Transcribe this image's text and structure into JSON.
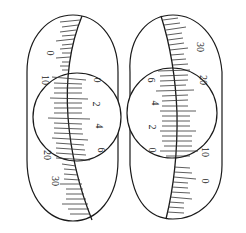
{
  "diagram": {
    "stroke_color": "#1a1a1a",
    "tick_color": "#333333",
    "left": {
      "thimble_scale_labels": [
        "0",
        "10",
        "20",
        "30"
      ],
      "sleeve_scale_labels": [
        "0",
        "2",
        "4",
        "6"
      ]
    },
    "right": {
      "thimble_scale_labels": [
        "30",
        "20",
        "10",
        "0"
      ],
      "sleeve_scale_labels": [
        "6",
        "4",
        "2",
        "0"
      ]
    }
  }
}
